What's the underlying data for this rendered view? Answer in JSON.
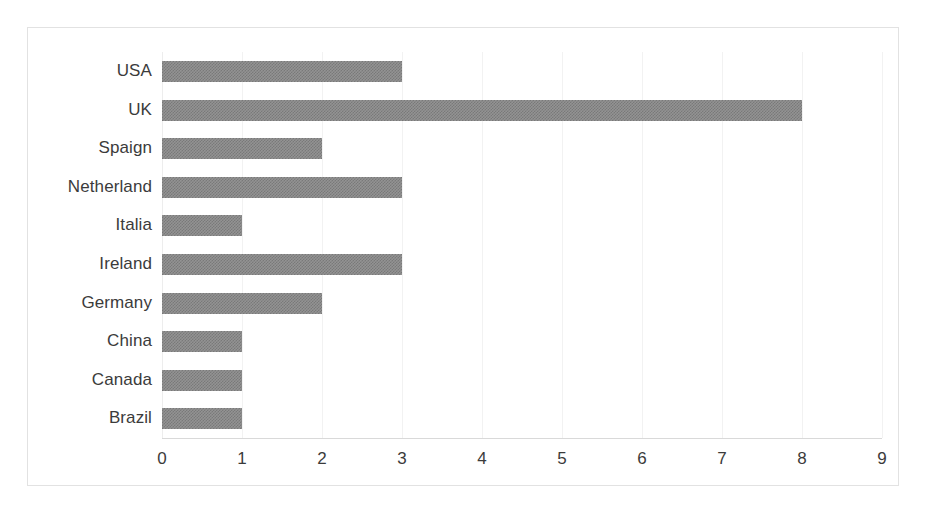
{
  "chart_data": {
    "type": "bar",
    "orientation": "horizontal",
    "title": "",
    "subtitle": "",
    "xlabel": "",
    "ylabel": "",
    "categories": [
      "USA",
      "UK",
      "Spaign",
      "Netherland",
      "Italia",
      "Ireland",
      "Germany",
      "China",
      "Canada",
      "Brazil"
    ],
    "values": [
      3,
      8,
      2,
      3,
      1,
      3,
      2,
      1,
      1,
      1
    ],
    "xticks": [
      "0",
      "1",
      "2",
      "3",
      "4",
      "5",
      "6",
      "7",
      "8",
      "9"
    ],
    "xtick_values": [
      0,
      1,
      2,
      3,
      4,
      5,
      6,
      7,
      8,
      9
    ],
    "xlim": [
      0,
      9
    ],
    "grid": true,
    "grid_axis": "x",
    "legend": false,
    "legend_position": "none",
    "bar_color": "#808080",
    "bar_fill_style": "dithered-checkerboard-gray",
    "plot_background": "#ffffff",
    "border_color": "#e2e2e2",
    "gridline_color": "#f2f2f2",
    "axis_line_color": "#d9d9d9",
    "text_color": "#3b3b3b",
    "annotations": []
  }
}
